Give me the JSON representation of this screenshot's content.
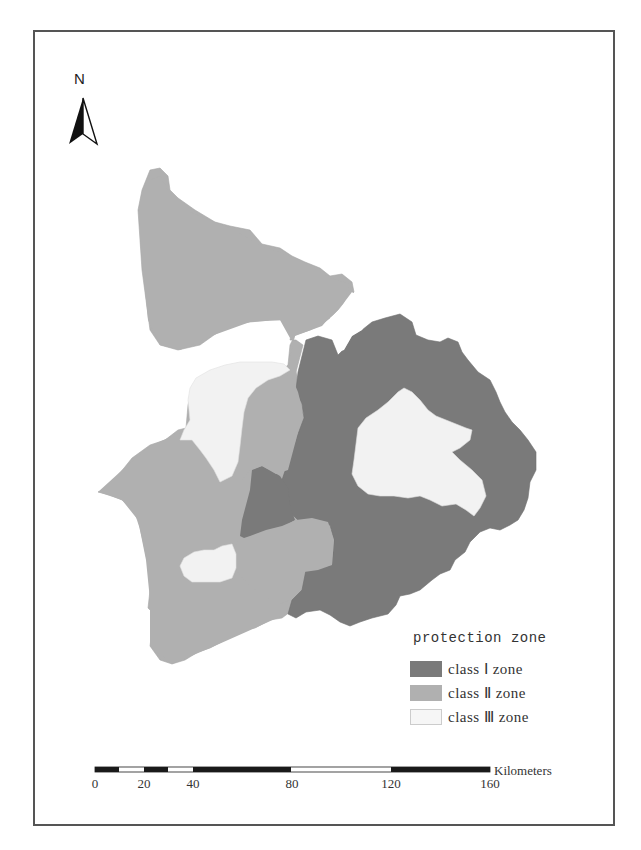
{
  "map": {
    "north_arrow": {
      "label": "N",
      "icon": "north-arrow-icon"
    },
    "colors": {
      "class1": "#7a7a7a",
      "class2": "#b0b0b0",
      "class3": "#f2f2f2",
      "frame": "#555555",
      "scale_dark": "#1a1a1a"
    },
    "legend": {
      "title": "protection zone",
      "items": [
        {
          "label": "class Ⅰ zone",
          "color": "#7a7a7a"
        },
        {
          "label": "class Ⅱ zone",
          "color": "#b0b0b0"
        },
        {
          "label": "class Ⅲ zone",
          "color": "#f2f2f2"
        }
      ]
    },
    "scale_bar": {
      "unit": "Kilometers",
      "ticks": [
        "0",
        "20",
        "40",
        "80",
        "120",
        "160"
      ]
    }
  }
}
